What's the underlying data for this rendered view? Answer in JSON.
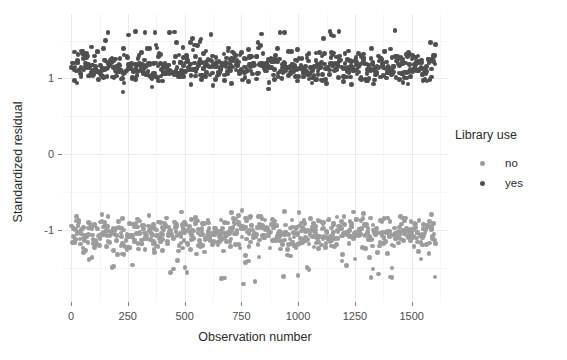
{
  "chart_data": {
    "type": "scatter",
    "title": "",
    "xlabel": "Observation number",
    "ylabel": "Standardized residual",
    "xlim": [
      -40,
      1660
    ],
    "ylim": [
      -1.95,
      1.85
    ],
    "xticks": [
      0,
      250,
      500,
      750,
      1000,
      1250,
      1500
    ],
    "yticks": [
      1,
      0,
      -1
    ],
    "xtick_labels": [
      "0",
      "250",
      "500",
      "750",
      "1000",
      "1250",
      "1500"
    ],
    "ytick_labels": [
      "1",
      "0",
      "-1"
    ],
    "x_minor_ticks": [
      125,
      375,
      625,
      875,
      1125,
      1375,
      1625
    ],
    "y_minor_ticks": [
      1.5,
      0.5,
      -0.5,
      -1.5
    ],
    "grid": true,
    "legend_position": "right",
    "point_size": 4.6,
    "series": [
      {
        "name": "no",
        "color": "#9c9c9c",
        "description": "Observations with library use = no; standardized residuals cluster near -1 (range roughly -1.75 to -0.75), spanning observation numbers 0 to about 1610",
        "n": 700,
        "y_center": -1.02,
        "y_spread": 0.17,
        "y_min": -1.78,
        "y_max": -0.74
      },
      {
        "name": "yes",
        "color": "#4f4f4f",
        "description": "Observations with library use = yes; standardized residuals cluster near 1.15 (range roughly 0.85 to 1.65), spanning observation numbers 0 to about 1610",
        "n": 700,
        "y_center": 1.14,
        "y_spread": 0.16,
        "y_min": 0.82,
        "y_max": 1.63
      }
    ]
  },
  "legend": {
    "title": "Library use",
    "items": [
      {
        "label": "no",
        "color": "#9c9c9c"
      },
      {
        "label": "yes",
        "color": "#4f4f4f"
      }
    ]
  },
  "axes": {
    "x_title": "Observation number",
    "y_title": "Standardized residual"
  },
  "colors": {
    "background": "#ffffff",
    "grid_major": "#ebebeb",
    "grid_minor": "#f6f6f6",
    "text": "#2b2b2b",
    "tick_text": "#4d4d4d",
    "series_no": "#9c9c9c",
    "series_yes": "#4f4f4f"
  }
}
